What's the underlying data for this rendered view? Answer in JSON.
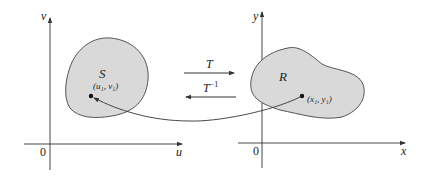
{
  "diagram": {
    "type": "change-of-variables-mapping",
    "colors": {
      "region_fill": "#d9d9d9",
      "region_stroke": "#555555",
      "axis": "#333333",
      "text": "#222222"
    },
    "left_plane": {
      "vertical_axis_label": "v",
      "horizontal_axis_label": "u",
      "origin_label": "0",
      "region_label": "S",
      "point_label": "(u₁, v₁)"
    },
    "right_plane": {
      "vertical_axis_label": "y",
      "horizontal_axis_label": "x",
      "origin_label": "0",
      "region_label": "R",
      "point_label": "(x₁, y₁)"
    },
    "transforms": {
      "forward_label": "T",
      "inverse_label": "T",
      "inverse_superscript": "−1"
    }
  }
}
